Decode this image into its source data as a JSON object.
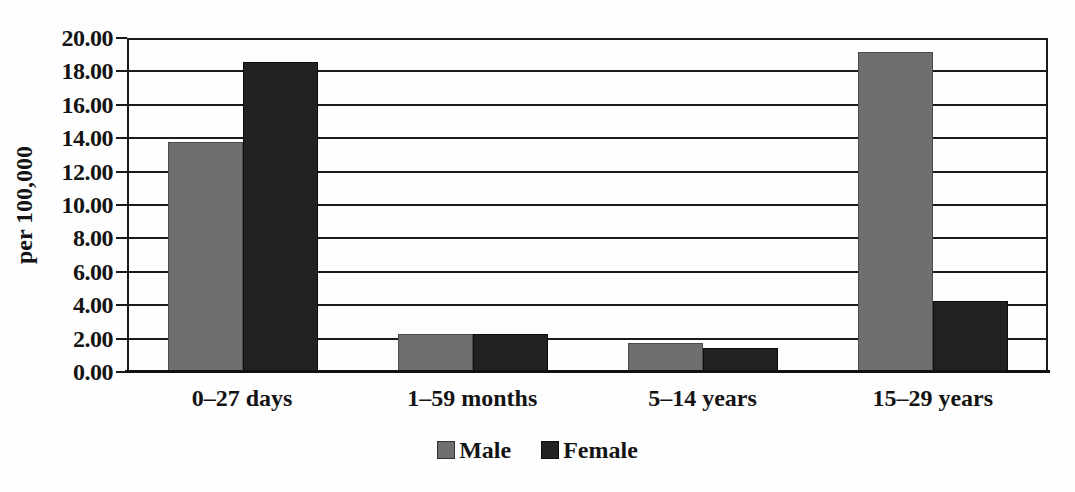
{
  "chart_data": {
    "type": "bar",
    "title": "",
    "xlabel": "",
    "ylabel": "per 100,000",
    "categories": [
      "0–27 days",
      "1–59 months",
      "5–14 years",
      "15–29 years"
    ],
    "series": [
      {
        "name": "Male",
        "color": "#6e6f71",
        "values": [
          13.7,
          2.2,
          1.7,
          19.1
        ]
      },
      {
        "name": "Female",
        "color": "#232122",
        "values": [
          18.5,
          2.2,
          1.4,
          4.2
        ]
      }
    ],
    "ylim": [
      0,
      20
    ],
    "ytick_step": 2,
    "ytick_labels": [
      "20.00",
      "18.00",
      "16.00",
      "14.00",
      "12.00",
      "10.00",
      "8.00",
      "6.00",
      "4.00",
      "2.00",
      "0.00"
    ],
    "grid": true,
    "legend_position": "bottom",
    "axis_color": "#1a1a1a",
    "background_color": "#fefefe"
  }
}
